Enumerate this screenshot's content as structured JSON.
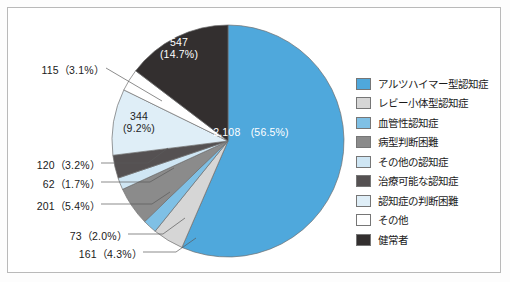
{
  "chart_data": {
    "type": "pie",
    "title": "",
    "total": 3731,
    "legend_position": "right",
    "start_angle_deg": 0,
    "direction": "clockwise",
    "center": {
      "x": 228,
      "y": 141,
      "r": 116
    },
    "categories": [
      "アルツハイマー型認知症",
      "レビー小体型認知症",
      "血管性認知症",
      "病型判断困難",
      "その他の認知症",
      "治療可能な認知症",
      "認知症の判断困難",
      "その他",
      "健常者"
    ],
    "values": [
      2108,
      161,
      73,
      201,
      62,
      120,
      344,
      115,
      547
    ],
    "percents": [
      56.5,
      4.3,
      2.0,
      5.4,
      1.7,
      3.2,
      9.2,
      3.1,
      14.7
    ],
    "colors": [
      "#4fa8dc",
      "#d6d6d6",
      "#7fc0e5",
      "#8b8b8b",
      "#cfe6f4",
      "#555152",
      "#dfeef7",
      "#ffffff",
      "#332f2f"
    ],
    "labels": [
      "2,108　(56.5%)",
      "161　(4.3%)",
      "73　(2.0%)",
      "201　(5.4%)",
      "62　(1.7%)",
      "120　(3.2%)",
      "344　(9.2%)",
      "115　(3.1%)",
      "547　(14.7%)"
    ]
  },
  "slice_labels": {
    "alzheimer_value": "2,108",
    "alzheimer_percent": "(56.5%)",
    "healthy_value": "547",
    "healthy_percent": "(14.7%)",
    "other_dementia_value": "344",
    "other_dementia_percent": "(9.2%)"
  },
  "callouts": {
    "c115": "115（3.1%）",
    "c120": "120（3.2%）",
    "c62": "62（1.7%）",
    "c201": "201（5.4%）",
    "c73": "73（2.0%）",
    "c161": "161（4.3%）"
  },
  "legend": {
    "items": [
      {
        "label": "アルツハイマー型認知症",
        "color": "#4fa8dc"
      },
      {
        "label": "レビー小体型認知症",
        "color": "#d6d6d6"
      },
      {
        "label": "血管性認知症",
        "color": "#7fc0e5"
      },
      {
        "label": "病型判断困難",
        "color": "#8b8b8b"
      },
      {
        "label": "その他の認知症",
        "color": "#cfe6f4"
      },
      {
        "label": "治療可能な認知症",
        "color": "#555152"
      },
      {
        "label": "認知症の判断困難",
        "color": "#dfeef7"
      },
      {
        "label": "その他",
        "color": "#ffffff"
      },
      {
        "label": "健常者",
        "color": "#332f2f"
      }
    ]
  }
}
